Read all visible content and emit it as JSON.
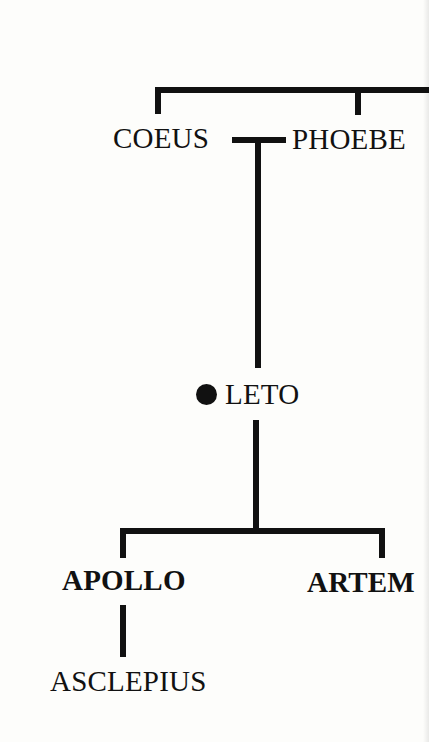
{
  "diagram": {
    "type": "family-tree",
    "colors": {
      "line": "#111111",
      "background": "#fdfdfb",
      "text": "#111111"
    },
    "nodes": {
      "coeus": {
        "label": "COEUS",
        "bold": false
      },
      "phoebe": {
        "label": "PHOEBE",
        "bold": false
      },
      "leto": {
        "label": "LETO",
        "bold": false,
        "marker": "filled-dot"
      },
      "apollo": {
        "label": "APOLLO",
        "bold": true
      },
      "artemis": {
        "label": "ARTEM",
        "bold": true,
        "truncated": true
      },
      "asclepius": {
        "label": "ASCLEPIUS",
        "bold": false
      }
    },
    "edges": [
      {
        "from": "parents-above",
        "to": "coeus",
        "type": "sibling-bracket"
      },
      {
        "from": "parents-above",
        "to": "phoebe",
        "type": "sibling-bracket"
      },
      {
        "from": "coeus",
        "to": "phoebe",
        "type": "marriage"
      },
      {
        "from": "coeus+phoebe",
        "to": "leto",
        "type": "descent"
      },
      {
        "from": "leto",
        "to": "apollo",
        "type": "descent"
      },
      {
        "from": "leto",
        "to": "artemis",
        "type": "descent"
      },
      {
        "from": "apollo",
        "to": "asclepius",
        "type": "descent"
      }
    ]
  }
}
